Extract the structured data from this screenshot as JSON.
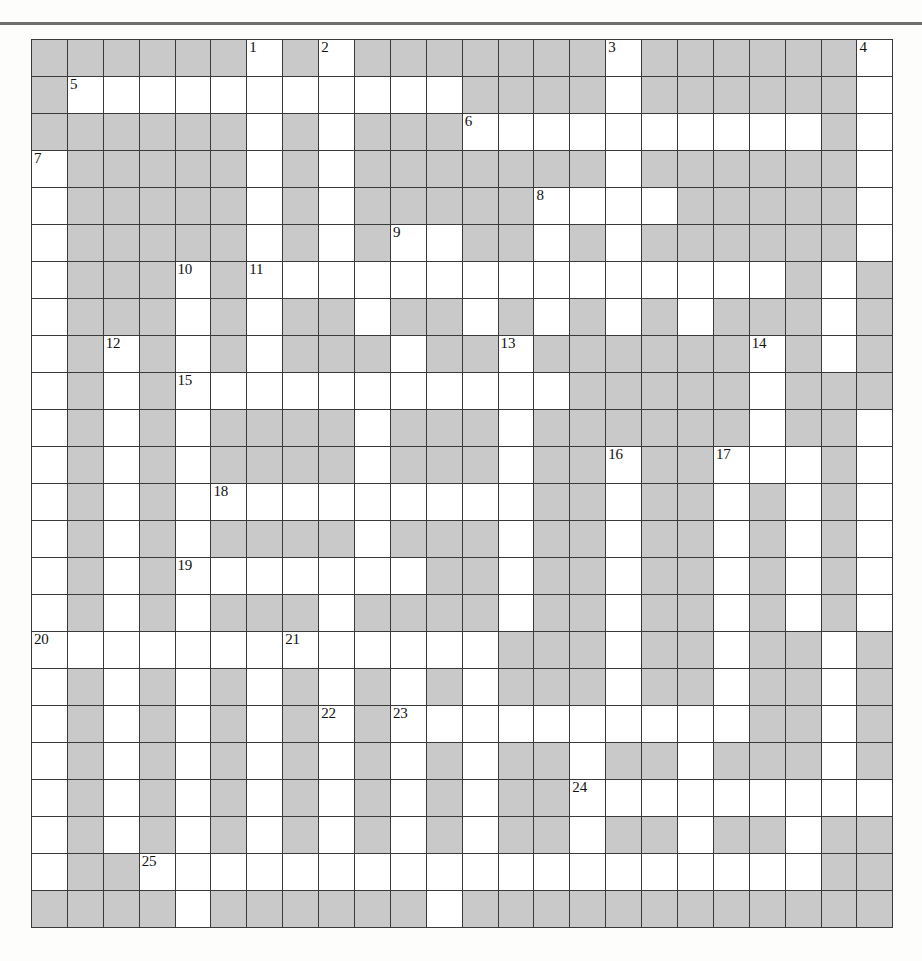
{
  "page": {
    "width": 922,
    "height": 961
  },
  "grid": {
    "rows": 24,
    "cols": 24,
    "cell_size_px": 35.9,
    "colors": {
      "open_cell": "#ffffff",
      "blocked_cell": "#c9c9c9",
      "grid_line": "#3a3a3a",
      "outer_border": "#2b2b2b",
      "number_text": "#111111",
      "top_rule": "#6e6e6e"
    },
    "legend": {
      "open": "white fillable square",
      "blocked": "gray shaded square"
    },
    "clue_numbers_total": 25,
    "clue_numbers": [
      1,
      2,
      3,
      4,
      5,
      6,
      7,
      8,
      9,
      10,
      11,
      12,
      13,
      14,
      15,
      16,
      17,
      18,
      19,
      20,
      21,
      22,
      23,
      24,
      25
    ],
    "cells": [
      [
        "B",
        "B",
        "B",
        "B",
        "B",
        "B",
        "O1",
        "B",
        "O2",
        "B",
        "B",
        "B",
        "B",
        "B",
        "B",
        "B",
        "O3",
        "B",
        "B",
        "B",
        "B",
        "B",
        "B",
        "O4"
      ],
      [
        "B",
        "O5",
        "O",
        "O",
        "O",
        "O",
        "O",
        "O",
        "O",
        "O",
        "O",
        "O",
        "B",
        "B",
        "B",
        "B",
        "O",
        "B",
        "B",
        "B",
        "B",
        "B",
        "B",
        "O"
      ],
      [
        "B",
        "B",
        "B",
        "B",
        "B",
        "B",
        "O",
        "B",
        "O",
        "B",
        "B",
        "B",
        "O6",
        "O",
        "O",
        "O",
        "O",
        "O",
        "O",
        "O",
        "O",
        "O",
        "B",
        "O"
      ],
      [
        "O7",
        "B",
        "B",
        "B",
        "B",
        "B",
        "O",
        "B",
        "O",
        "B",
        "B",
        "B",
        "B",
        "B",
        "B",
        "B",
        "O",
        "B",
        "B",
        "B",
        "B",
        "B",
        "B",
        "O"
      ],
      [
        "O",
        "B",
        "B",
        "B",
        "B",
        "B",
        "O",
        "B",
        "O",
        "B",
        "B",
        "B",
        "B",
        "B",
        "O8",
        "O",
        "O",
        "O",
        "B",
        "B",
        "B",
        "B",
        "B",
        "O"
      ],
      [
        "O",
        "B",
        "B",
        "B",
        "B",
        "B",
        "O",
        "B",
        "O",
        "B",
        "O9",
        "O",
        "B",
        "B",
        "O",
        "B",
        "O",
        "B",
        "B",
        "B",
        "B",
        "B",
        "B",
        "O"
      ],
      [
        "O",
        "B",
        "B",
        "B",
        "O10",
        "B",
        "O11",
        "O",
        "O",
        "O",
        "O",
        "O",
        "O",
        "O",
        "O",
        "O",
        "O",
        "O",
        "O",
        "O",
        "O",
        "B",
        "O",
        "B"
      ],
      [
        "O",
        "B",
        "B",
        "B",
        "O",
        "B",
        "O",
        "B",
        "B",
        "O",
        "B",
        "B",
        "O",
        "B",
        "O",
        "B",
        "O",
        "B",
        "O",
        "B",
        "B",
        "B",
        "O",
        "B"
      ],
      [
        "O",
        "B",
        "O12",
        "B",
        "O",
        "B",
        "O",
        "B",
        "B",
        "B",
        "O",
        "B",
        "B",
        "O13",
        "B",
        "B",
        "B",
        "B",
        "B",
        "B",
        "O14",
        "B",
        "O",
        "B"
      ],
      [
        "O",
        "B",
        "O",
        "B",
        "O15",
        "O",
        "O",
        "O",
        "O",
        "O",
        "O",
        "O",
        "O",
        "O",
        "O",
        "B",
        "B",
        "B",
        "B",
        "B",
        "O",
        "B",
        "B",
        "B"
      ],
      [
        "O",
        "B",
        "O",
        "B",
        "O",
        "B",
        "B",
        "B",
        "B",
        "O",
        "B",
        "B",
        "B",
        "O",
        "B",
        "B",
        "B",
        "B",
        "B",
        "B",
        "O",
        "B",
        "B",
        "O"
      ],
      [
        "O",
        "B",
        "O",
        "B",
        "O",
        "B",
        "B",
        "B",
        "B",
        "O",
        "B",
        "B",
        "B",
        "O",
        "B",
        "B",
        "O16",
        "B",
        "B",
        "O17",
        "O",
        "O",
        "B",
        "O"
      ],
      [
        "O",
        "B",
        "O",
        "B",
        "O",
        "O18",
        "O",
        "O",
        "O",
        "O",
        "O",
        "O",
        "O",
        "O",
        "B",
        "B",
        "O",
        "B",
        "B",
        "O",
        "B",
        "O",
        "B",
        "O"
      ],
      [
        "O",
        "B",
        "O",
        "B",
        "O",
        "B",
        "B",
        "B",
        "B",
        "O",
        "B",
        "B",
        "B",
        "O",
        "B",
        "B",
        "O",
        "B",
        "B",
        "O",
        "B",
        "O",
        "B",
        "O"
      ],
      [
        "O",
        "B",
        "O",
        "B",
        "O19",
        "O",
        "O",
        "O",
        "O",
        "O",
        "O",
        "B",
        "B",
        "O",
        "B",
        "B",
        "O",
        "B",
        "B",
        "O",
        "B",
        "O",
        "B",
        "O"
      ],
      [
        "O",
        "B",
        "O",
        "B",
        "O",
        "B",
        "B",
        "B",
        "O",
        "B",
        "B",
        "B",
        "B",
        "O",
        "B",
        "B",
        "O",
        "B",
        "B",
        "O",
        "B",
        "O",
        "B",
        "O"
      ],
      [
        "O20",
        "O",
        "O",
        "O",
        "O",
        "O",
        "O",
        "O21",
        "O",
        "O",
        "O",
        "O",
        "O",
        "B",
        "B",
        "B",
        "O",
        "B",
        "B",
        "O",
        "B",
        "B",
        "O",
        "B"
      ],
      [
        "O",
        "B",
        "O",
        "B",
        "O",
        "B",
        "O",
        "B",
        "O",
        "B",
        "O",
        "B",
        "O",
        "B",
        "B",
        "B",
        "O",
        "B",
        "B",
        "O",
        "B",
        "B",
        "O",
        "B"
      ],
      [
        "O",
        "B",
        "O",
        "B",
        "O",
        "B",
        "O",
        "B",
        "O22",
        "B",
        "O23",
        "O",
        "O",
        "O",
        "O",
        "O",
        "O",
        "O",
        "O",
        "O",
        "B",
        "B",
        "O",
        "B"
      ],
      [
        "O",
        "B",
        "O",
        "B",
        "O",
        "B",
        "O",
        "B",
        "O",
        "B",
        "O",
        "B",
        "O",
        "B",
        "B",
        "O",
        "B",
        "B",
        "O",
        "B",
        "B",
        "B",
        "O",
        "B"
      ],
      [
        "O",
        "B",
        "O",
        "B",
        "O",
        "B",
        "O",
        "B",
        "O",
        "B",
        "O",
        "B",
        "O",
        "B",
        "B",
        "O24",
        "O",
        "O",
        "O",
        "O",
        "O",
        "O",
        "O",
        "O"
      ],
      [
        "O",
        "B",
        "O",
        "B",
        "O",
        "B",
        "O",
        "B",
        "O",
        "B",
        "O",
        "B",
        "O",
        "B",
        "B",
        "O",
        "B",
        "B",
        "O",
        "B",
        "B",
        "O",
        "B",
        "B"
      ],
      [
        "O",
        "B",
        "B",
        "O25",
        "O",
        "O",
        "O",
        "O",
        "O",
        "O",
        "O",
        "O",
        "O",
        "O",
        "O",
        "O",
        "O",
        "O",
        "O",
        "O",
        "O",
        "O",
        "B",
        "B"
      ],
      [
        "B",
        "B",
        "B",
        "B",
        "O",
        "B",
        "B",
        "B",
        "B",
        "B",
        "B",
        "O",
        "B",
        "B",
        "B",
        "B",
        "B",
        "B",
        "B",
        "B",
        "B",
        "B",
        "B",
        "B"
      ]
    ]
  }
}
